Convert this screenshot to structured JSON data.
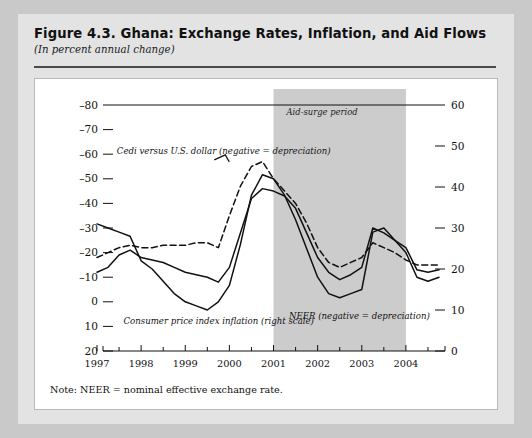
{
  "figure": {
    "title": "Figure 4.3. Ghana: Exchange Rates, Inflation, and Aid Flows",
    "subtitle": "(In percent annual change)",
    "note": "Note: NEER = nominal effective exchange rate."
  },
  "colors": {
    "page_background": "#c9c9c9",
    "panel_background": "#e3e3e3",
    "plot_background": "#ffffff",
    "band_fill": "#cccccc",
    "line": "#111111",
    "rule": "#4a4a4a"
  },
  "chart_data": {
    "type": "line",
    "title": "Figure 4.3. Ghana: Exchange Rates, Inflation, and Aid Flows",
    "subtitle": "(In percent annual change)",
    "xlabel": "",
    "ylabel": "",
    "grid": false,
    "legend_position": "inline-annotations",
    "xlim": [
      1997,
      2004.75
    ],
    "x_major_ticks": [
      1997,
      1998,
      1999,
      2000,
      2001,
      2002,
      2003,
      2004
    ],
    "x_minor_ticks": [
      1997.5,
      1998.5,
      1999.5,
      2000.5,
      2001.5,
      2002.5,
      2003.5,
      2004.5
    ],
    "x_tick_labels": [
      "1997",
      "1998",
      "1999",
      "2000",
      "2001",
      "2002",
      "2003",
      "2004"
    ],
    "left_axis": {
      "label": "",
      "inverted": true,
      "ylim": [
        -80,
        20
      ],
      "ticks": [
        -80,
        -70,
        -60,
        -50,
        -40,
        -30,
        -20,
        -10,
        0,
        10,
        20
      ],
      "tick_labels": [
        "–80",
        "–70",
        "–60",
        "–50",
        "–40",
        "–30",
        "–20",
        "–10",
        "0",
        "10",
        "20"
      ]
    },
    "right_axis": {
      "label": "",
      "inverted": false,
      "ylim": [
        0,
        60
      ],
      "ticks": [
        0,
        10,
        20,
        30,
        40,
        50,
        60
      ],
      "tick_labels": [
        "0",
        "10",
        "20",
        "30",
        "40",
        "50",
        "60"
      ]
    },
    "bands": [
      {
        "name": "Aid-surge period",
        "label": "Aid-surge period",
        "x_start": 2001,
        "x_end": 2004,
        "fill": "#cccccc"
      }
    ],
    "annotations": [
      {
        "text": "Cedi versus U.S. dollar (negative = depreciation)",
        "x": 1997.45,
        "y_left": -60,
        "style": "italic"
      },
      {
        "text": "Consumer price index inflation (right scale)",
        "x": 1997.6,
        "y_left": 9,
        "style": "italic"
      },
      {
        "text": "NEER (negative = depreciation)",
        "x": 2001.35,
        "y_left": 7,
        "style": "italic"
      },
      {
        "text": "Aid-surge period",
        "x": 2002.1,
        "y_left": -76,
        "style": "italic"
      }
    ],
    "series": [
      {
        "name": "Cedi versus U.S. dollar (negative = depreciation)",
        "axis": "left",
        "style": "dashed",
        "color": "#111111",
        "x": [
          1997.0,
          1997.25,
          1997.5,
          1997.75,
          1998.0,
          1998.25,
          1998.5,
          1998.75,
          1999.0,
          1999.25,
          1999.5,
          1999.75,
          2000.0,
          2000.25,
          2000.5,
          2000.75,
          2001.0,
          2001.25,
          2001.5,
          2001.75,
          2002.0,
          2002.25,
          2002.5,
          2002.75,
          2003.0,
          2003.25,
          2003.5,
          2003.75,
          2004.0,
          2004.25,
          2004.5,
          2004.75
        ],
        "values": [
          -18,
          -20,
          -22,
          -23,
          -22,
          -22,
          -23,
          -23,
          -23,
          -24,
          -24,
          -22,
          -35,
          -47,
          -55,
          -57,
          -50,
          -45,
          -40,
          -32,
          -22,
          -16,
          -14,
          -16,
          -18,
          -24,
          -22,
          -20,
          -17,
          -15,
          -15,
          -15
        ]
      },
      {
        "name": "NEER (negative = depreciation)",
        "axis": "left",
        "style": "solid",
        "color": "#111111",
        "x": [
          1997.0,
          1997.25,
          1997.5,
          1997.75,
          1998.0,
          1998.25,
          1998.5,
          1998.75,
          1999.0,
          1999.25,
          1999.5,
          1999.75,
          2000.0,
          2000.25,
          2000.5,
          2000.75,
          2001.0,
          2001.25,
          2001.5,
          2001.75,
          2002.0,
          2002.25,
          2002.5,
          2002.75,
          2003.0,
          2003.25,
          2003.5,
          2003.75,
          2004.0,
          2004.25,
          2004.5,
          2004.75
        ],
        "values": [
          -12,
          -14,
          -19,
          -21,
          -18,
          -17,
          -16,
          -14,
          -12,
          -11,
          -10,
          -8,
          -14,
          -28,
          -42,
          -46,
          -45,
          -43,
          -38,
          -28,
          -18,
          -12,
          -9,
          -11,
          -14,
          -30,
          -28,
          -25,
          -22,
          -13,
          -12,
          -13
        ]
      },
      {
        "name": "Consumer price index inflation (right scale)",
        "axis": "right",
        "style": "solid",
        "color": "#111111",
        "x": [
          1997.0,
          1997.25,
          1997.5,
          1997.75,
          1998.0,
          1998.25,
          1998.5,
          1998.75,
          1999.0,
          1999.25,
          1999.5,
          1999.75,
          2000.0,
          2000.25,
          2000.5,
          2000.75,
          2001.0,
          2001.25,
          2001.5,
          2001.75,
          2002.0,
          2002.25,
          2002.5,
          2002.75,
          2003.0,
          2003.25,
          2003.5,
          2003.75,
          2004.0,
          2004.25,
          2004.5,
          2004.75
        ],
        "values": [
          31,
          30,
          29,
          28,
          22,
          20,
          17,
          14,
          12,
          11,
          10,
          12,
          16,
          26,
          38,
          43,
          42,
          38,
          32,
          25,
          18,
          14,
          13,
          14,
          15,
          29,
          30,
          27,
          24,
          18,
          17,
          18
        ]
      }
    ]
  }
}
